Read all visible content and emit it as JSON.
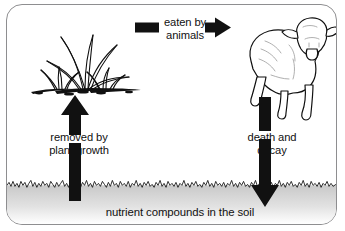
{
  "diagram": {
    "border_color": "#8e8e90",
    "ink_color": "#111111",
    "soil_gradient_top": "#c9c9c9",
    "soil_gradient_bottom": "#ffffff",
    "labels": {
      "eaten_by_animals": "eaten by\nanimals",
      "removed_by_plant_growth": "removed by\nplant growth",
      "death_and_decay": "death and\ndecay",
      "nutrient_compounds": "nutrient compounds in the soil"
    },
    "illustrations": [
      {
        "name": "grass-plant-illustration",
        "alt": "clump of grass growing in soil"
      },
      {
        "name": "sheep-illustration",
        "alt": "sheep facing forward"
      }
    ],
    "arrows": [
      {
        "name": "arrow-eaten-by-animals",
        "direction": "right",
        "label": "eaten by animals"
      },
      {
        "name": "arrow-removed-by-plant-growth",
        "direction": "up",
        "label": "removed by plant growth"
      },
      {
        "name": "arrow-death-and-decay",
        "direction": "down",
        "label": "death and decay"
      }
    ],
    "soil_line": {
      "name": "soil-surface-line",
      "style": "jagged"
    }
  }
}
